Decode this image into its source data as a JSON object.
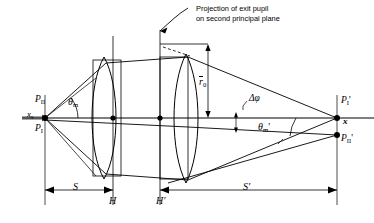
{
  "figure": {
    "title_note": {
      "line1": "Projection of exit pupil",
      "line2": "on second principal plane"
    },
    "axis_label": "x",
    "axis_label_sub": "s",
    "axis_label_right": "x",
    "object_points": [
      {
        "name": "P_II",
        "base": "P",
        "sub": "II",
        "prime": ""
      },
      {
        "name": "P_I",
        "base": "P",
        "sub": "I",
        "prime": ""
      }
    ],
    "image_points": [
      {
        "name": "P_I_prime",
        "base": "P",
        "sub": "I",
        "prime": "'"
      },
      {
        "name": "P_II_prime",
        "base": "P",
        "sub": "II",
        "prime": "'"
      }
    ],
    "angles": [
      {
        "name": "theta_m",
        "glyph": "θ",
        "sub": "m",
        "prime": ""
      },
      {
        "name": "theta_m_prime",
        "glyph": "θ",
        "sub": "m",
        "prime": "'"
      },
      {
        "name": "delta_phi",
        "glyph": "Δφ",
        "sub": "",
        "prime": ""
      }
    ],
    "radius_label": {
      "base": "r",
      "sub": "0",
      "overbar": true
    },
    "principal_planes": [
      {
        "name": "H",
        "label": "H"
      },
      {
        "name": "H_prime",
        "label": "H'"
      }
    ],
    "distances": [
      {
        "name": "S",
        "label": "S"
      },
      {
        "name": "S_prime",
        "label": "S'"
      }
    ],
    "colors": {
      "ink": "#000000",
      "axis": "#444444",
      "background": "#ffffff"
    }
  }
}
